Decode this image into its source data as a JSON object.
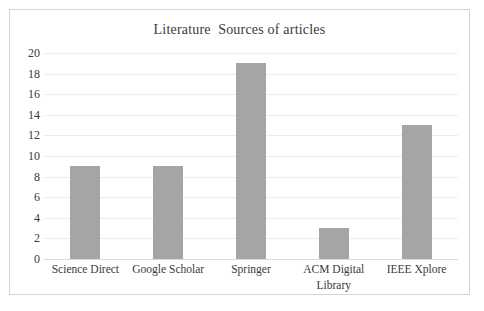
{
  "chart_data": {
    "type": "bar",
    "title": "Literature  Sources of articles",
    "xlabel": "",
    "ylabel": "",
    "categories": [
      "Science Direct",
      "Google Scholar",
      "Springer",
      "ACM Digital Library",
      "IEEE Xplore"
    ],
    "category_lines": [
      [
        "Science Direct"
      ],
      [
        "Google Scholar"
      ],
      [
        "Springer"
      ],
      [
        "ACM Digital",
        "Library"
      ],
      [
        "IEEE Xplore"
      ]
    ],
    "values": [
      9,
      9,
      19,
      3,
      13
    ],
    "ylim": [
      0,
      20
    ],
    "ytick_step": 2,
    "yticks": [
      "20",
      "18",
      "16",
      "14",
      "12",
      "10",
      "8",
      "6",
      "4",
      "2",
      "0"
    ],
    "ytick_values": [
      20,
      18,
      16,
      14,
      12,
      10,
      8,
      6,
      4,
      2,
      0
    ],
    "grid": true,
    "legend": false,
    "colors": {
      "bar": "#a5a5a5",
      "gridline": "#ededed",
      "baseline": "#dadada",
      "text": "#3a3a3a",
      "frame_border": "#d4d4d4",
      "background": "#ffffff"
    }
  }
}
